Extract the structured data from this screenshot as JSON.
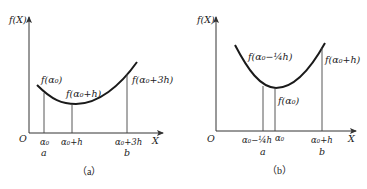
{
  "panels": [
    {
      "id": "a",
      "caption": "（a）",
      "y_axis_label": "f(X)",
      "x_axis_label": "X",
      "origin_label": "O",
      "curve_labels": {
        "left": "f(α₀)",
        "middle": "f(α₀+h)",
        "right": "f(α₀+3h)"
      },
      "x_ticks": [
        {
          "label": "α₀",
          "sublabel": "a"
        },
        {
          "label": "α₀+h",
          "sublabel": ""
        },
        {
          "label": "α₀+3h",
          "sublabel": "b"
        }
      ]
    },
    {
      "id": "b",
      "caption": "（b）",
      "y_axis_label": "f(X)",
      "x_axis_label": "X",
      "origin_label": "O",
      "curve_labels": {
        "left": "f(α₀−¼h)",
        "middle": "f(α₀)",
        "right": "f(α₀+h)"
      },
      "x_ticks": [
        {
          "label": "α₀−¼h",
          "sublabel": "a"
        },
        {
          "label": "α₀",
          "sublabel": ""
        },
        {
          "label": "α₀+h",
          "sublabel": "b"
        }
      ]
    }
  ]
}
